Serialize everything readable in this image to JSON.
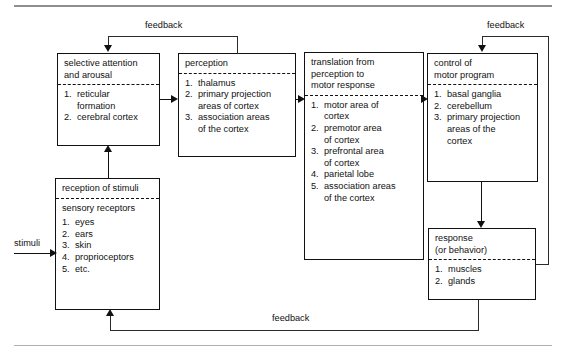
{
  "diagram": {
    "rules": {
      "top": "horizontal-rule",
      "bottom": "horizontal-rule"
    },
    "boxes": {
      "selective_attention": {
        "header": [
          "selective attention",
          "and arousal"
        ],
        "items": [
          "reticular\nformation",
          "cerebral cortex"
        ],
        "items_flat": [
          {
            "n": "1.",
            "lines": [
              "reticular",
              "formation"
            ]
          },
          {
            "n": "2.",
            "lines": [
              "cerebral cortex"
            ]
          }
        ]
      },
      "perception": {
        "header": [
          "perception"
        ],
        "items_flat": [
          {
            "n": "1.",
            "lines": [
              "thalamus"
            ]
          },
          {
            "n": "2.",
            "lines": [
              "primary projection",
              "areas of cortex"
            ]
          },
          {
            "n": "3.",
            "lines": [
              "association areas",
              "of the cortex"
            ]
          }
        ]
      },
      "translation": {
        "header": [
          "translation from",
          "perception to",
          "motor response"
        ],
        "items_flat": [
          {
            "n": "1.",
            "lines": [
              "motor area of",
              "cortex"
            ]
          },
          {
            "n": "2.",
            "lines": [
              "premotor area",
              "of cortex"
            ]
          },
          {
            "n": "3.",
            "lines": [
              "prefrontal area",
              "of cortex"
            ]
          },
          {
            "n": "4.",
            "lines": [
              "parietal lobe"
            ]
          },
          {
            "n": "5.",
            "lines": [
              "association areas",
              "of the cortex"
            ]
          }
        ]
      },
      "control": {
        "header": [
          "control of",
          "motor program"
        ],
        "items_flat": [
          {
            "n": "1.",
            "lines": [
              "basal ganglia"
            ]
          },
          {
            "n": "2.",
            "lines": [
              "cerebellum"
            ]
          },
          {
            "n": "3.",
            "lines": [
              "primary projection",
              "areas of the",
              "cortex"
            ]
          }
        ]
      },
      "response": {
        "header": [
          "response",
          "(or behavior)"
        ],
        "items_flat": [
          {
            "n": "1.",
            "lines": [
              "muscles"
            ]
          },
          {
            "n": "2.",
            "lines": [
              "glands"
            ]
          }
        ]
      },
      "reception": {
        "header": [
          "reception of stimuli"
        ],
        "subheader": "sensory receptors",
        "items_flat": [
          {
            "n": "1.",
            "lines": [
              "eyes"
            ]
          },
          {
            "n": "2.",
            "lines": [
              "ears"
            ]
          },
          {
            "n": "3.",
            "lines": [
              "skin"
            ]
          },
          {
            "n": "4.",
            "lines": [
              "proprioceptors"
            ]
          },
          {
            "n": "5.",
            "lines": [
              "etc."
            ]
          }
        ]
      }
    },
    "labels": {
      "feedback_top_left": "feedback",
      "feedback_top_right": "feedback",
      "feedback_bottom": "feedback",
      "stimuli": "stimuli"
    },
    "colors": {
      "box_border": "#111111",
      "divider": "#111111",
      "connector": "#111111",
      "rule": "#9a9a9a",
      "background": "#ffffff"
    }
  }
}
